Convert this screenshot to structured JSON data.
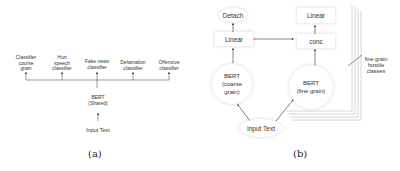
{
  "panel_a": {
    "classifiers": [
      {
        "label": "Classifier coarse grain",
        "lines": [
          "Classifier",
          "course",
          "grain"
        ]
      },
      {
        "label": "Hurt speech classifier",
        "lines": [
          "Hurt",
          "speech",
          "classifier"
        ]
      },
      {
        "label": "Fake news classifier",
        "lines": [
          "Fake news",
          "classifier"
        ]
      },
      {
        "label": "Defamation classifier",
        "lines": [
          "Defamation",
          "classifier"
        ]
      },
      {
        "label": "Offensive classifier",
        "lines": [
          "Offensive",
          "classifier"
        ]
      }
    ],
    "encoder": {
      "line1": "BERT",
      "line2": "(Shared)"
    },
    "input": "Input Text",
    "caption": "(a)"
  },
  "panel_b": {
    "detach": "Detach",
    "linear_left": "Linear",
    "linear_right": "Linear",
    "conc": "conc",
    "bert_coarse": {
      "line1": "BERT",
      "line2": "(coarse",
      "line3": "grain)"
    },
    "bert_fine": {
      "line1": "BERT",
      "line2": "(fine grain)"
    },
    "input": "Input Text",
    "stack_label": {
      "line1": "fine grain",
      "line2": "hostile",
      "line3": "classes"
    },
    "caption": "(b)"
  }
}
